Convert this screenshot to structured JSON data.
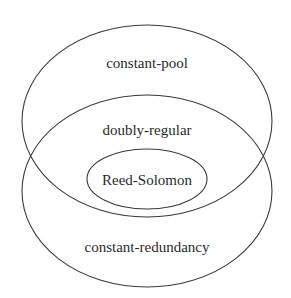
{
  "diagram": {
    "type": "venn",
    "sets": [
      {
        "id": "constant-pool",
        "label": "constant-pool"
      },
      {
        "id": "constant-redundancy",
        "label": "constant-redundancy"
      },
      {
        "id": "doubly-regular",
        "label": "doubly-regular",
        "region": "intersection of constant-pool and constant-redundancy"
      },
      {
        "id": "reed-solomon",
        "label": "Reed-Solomon",
        "region": "subset of doubly-regular"
      }
    ],
    "colors": {
      "stroke": "#3a3a3a",
      "text": "#2a2a2a",
      "background": "#ffffff"
    }
  }
}
